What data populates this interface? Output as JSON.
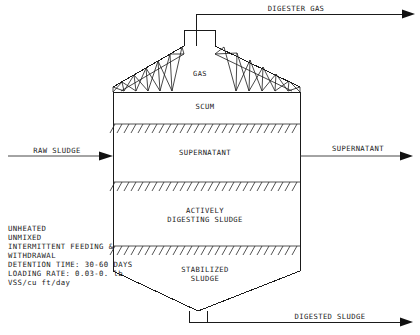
{
  "diagram": {
    "vessel": {
      "gas_space_label": "GAS",
      "zones": [
        {
          "id": "scum",
          "label": "SCUM",
          "label_lines": [
            "SCUM"
          ]
        },
        {
          "id": "supernatant",
          "label": "SUPERNATANT",
          "label_lines": [
            "SUPERNATANT"
          ]
        },
        {
          "id": "actively-digesting-sludge",
          "label": "ACTIVELY DIGESTING SLUDGE",
          "label_lines": [
            "ACTIVELY",
            "DIGESTING SLUDGE"
          ]
        },
        {
          "id": "stabilized-sludge",
          "label": "STABILIZED SLUDGE",
          "label_lines": [
            "STABILIZED",
            "SLUDGE"
          ]
        }
      ]
    },
    "flows": {
      "digester_gas": "DIGESTER GAS",
      "raw_sludge": "RAW SLUDGE",
      "supernatant_out": "SUPERNATANT",
      "digested_sludge": "DIGESTED SLUDGE"
    },
    "notes": {
      "lines": [
        "UNHEATED",
        "UNMIXED",
        "INTERMITTENT FEEDING &",
        "WITHDRAWAL",
        "DETENTION TIME: 30-60 DAYS",
        "LOADING RATE: 0.03-0. lb",
        "VSS/cu ft/day"
      ]
    },
    "colors": {
      "line": "#1a1a1a",
      "text": "#1a1a1a",
      "background": "#ffffff"
    }
  }
}
